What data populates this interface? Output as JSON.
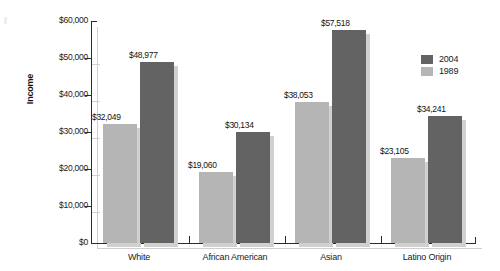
{
  "chart_data": {
    "type": "bar",
    "title": "",
    "xlabel": "",
    "ylabel": "Income",
    "categories": [
      "White",
      "African American",
      "Asian",
      "Latino Origin"
    ],
    "series": [
      {
        "name": "1989",
        "color": "#b5b5b5",
        "values": [
          32049,
          19060,
          38053,
          23105
        ],
        "labels": [
          "$32,049",
          "$19,060",
          "$38,053",
          "$23,105"
        ]
      },
      {
        "name": "2004",
        "color": "#636363",
        "values": [
          48977,
          30134,
          57518,
          34241
        ],
        "labels": [
          "$48,977",
          "$30,134",
          "$57,518",
          "$34,241"
        ]
      }
    ],
    "ylim": [
      0,
      60000
    ],
    "yticks": [
      0,
      10000,
      20000,
      30000,
      40000,
      50000,
      60000
    ],
    "ytick_labels": [
      "$0",
      "$10,000",
      "$20,000",
      "$30,000",
      "$40,000",
      "$50,000",
      "$60,000"
    ],
    "grid": false,
    "legend_position": "right"
  },
  "legend": {
    "entries": [
      {
        "label": "2004",
        "color": "#636363"
      },
      {
        "label": "1989",
        "color": "#b5b5b5"
      }
    ]
  }
}
